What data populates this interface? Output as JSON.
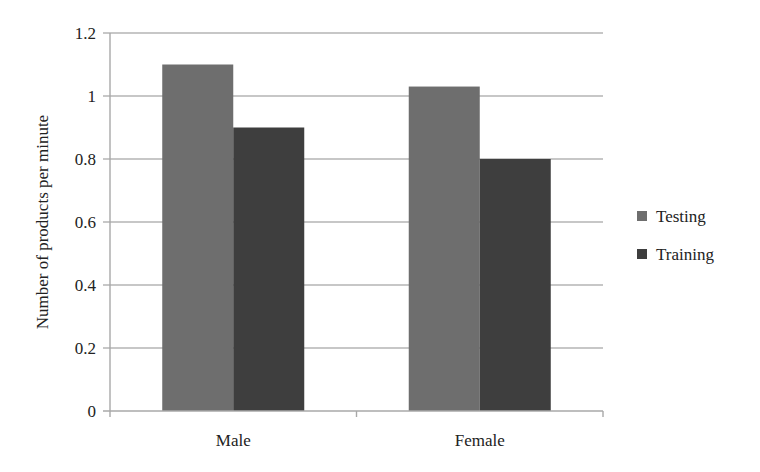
{
  "chart_data": {
    "type": "bar",
    "title": "",
    "xlabel": "",
    "ylabel": "Number of products per minute",
    "categories": [
      "Male",
      "Female"
    ],
    "series": [
      {
        "name": "Testing",
        "values": [
          1.1,
          1.03
        ],
        "color": "#6e6e6e"
      },
      {
        "name": "Training",
        "values": [
          0.9,
          0.8
        ],
        "color": "#3e3e3e"
      }
    ],
    "ylim": [
      0,
      1.2
    ],
    "yticks": [
      0,
      0.2,
      0.4,
      0.6,
      0.8,
      1,
      1.2
    ],
    "ytick_labels": [
      "0",
      "0.2",
      "0.4",
      "0.6",
      "0.8",
      "1",
      "1.2"
    ],
    "grid": true,
    "legend_position": "right"
  }
}
